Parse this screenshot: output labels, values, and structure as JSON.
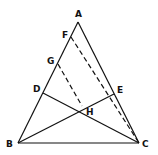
{
  "diagram": {
    "points": {
      "A": {
        "label": "A",
        "x": 78,
        "y": 22,
        "lx": 75,
        "ly": 17
      },
      "B": {
        "label": "B",
        "x": 18,
        "y": 143,
        "lx": 6,
        "ly": 147
      },
      "C": {
        "label": "C",
        "x": 139,
        "y": 143,
        "lx": 142,
        "ly": 147
      },
      "D": {
        "label": "D",
        "x": 43,
        "y": 93,
        "lx": 33,
        "ly": 92
      },
      "E": {
        "label": "E",
        "x": 114,
        "y": 94,
        "lx": 117,
        "ly": 93
      },
      "F": {
        "label": "F",
        "x": 71,
        "y": 37,
        "lx": 62,
        "ly": 38
      },
      "G": {
        "label": "G",
        "x": 58,
        "y": 64,
        "lx": 47,
        "ly": 64
      },
      "H": {
        "label": "H",
        "x": 80,
        "y": 110,
        "lx": 86,
        "ly": 115
      }
    },
    "colors": {
      "stroke": "#111111"
    }
  }
}
